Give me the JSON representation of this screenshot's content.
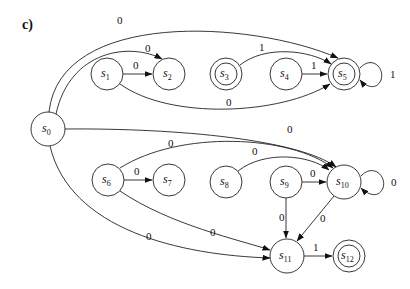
{
  "panel_label": "c)",
  "nodes": [
    {
      "id": "s0",
      "base": "s",
      "sub": "0",
      "x": 48,
      "y": 129,
      "r": 17,
      "accepting": false
    },
    {
      "id": "s1",
      "base": "s",
      "sub": "1",
      "x": 107,
      "y": 74,
      "r": 16,
      "accepting": false
    },
    {
      "id": "s2",
      "base": "s",
      "sub": "2",
      "x": 169,
      "y": 74,
      "r": 16,
      "accepting": false
    },
    {
      "id": "s3",
      "base": "s",
      "sub": "3",
      "x": 226,
      "y": 74,
      "r": 16,
      "accepting": true
    },
    {
      "id": "s4",
      "base": "s",
      "sub": "4",
      "x": 286,
      "y": 74,
      "r": 16,
      "accepting": false
    },
    {
      "id": "s5",
      "base": "s",
      "sub": "5",
      "x": 344,
      "y": 74,
      "r": 16,
      "accepting": true
    },
    {
      "id": "s6",
      "base": "s",
      "sub": "6",
      "x": 108,
      "y": 180,
      "r": 16,
      "accepting": false
    },
    {
      "id": "s7",
      "base": "s",
      "sub": "7",
      "x": 169,
      "y": 180,
      "r": 16,
      "accepting": false
    },
    {
      "id": "s8",
      "base": "s",
      "sub": "8",
      "x": 226,
      "y": 182,
      "r": 16,
      "accepting": false
    },
    {
      "id": "s9",
      "base": "s",
      "sub": "9",
      "x": 286,
      "y": 182,
      "r": 16,
      "accepting": false
    },
    {
      "id": "s10",
      "base": "s",
      "sub": "10",
      "x": 344,
      "y": 182,
      "r": 17,
      "accepting": false
    },
    {
      "id": "s11",
      "base": "s",
      "sub": "11",
      "x": 287,
      "y": 256,
      "r": 17,
      "accepting": false
    },
    {
      "id": "s12",
      "base": "s",
      "sub": "12",
      "x": 349,
      "y": 256,
      "r": 16,
      "accepting": true
    }
  ],
  "edges": [
    {
      "from": "s0",
      "to": "s5",
      "label": "0",
      "path": "M49,112 C60,10 250,20 338,58",
      "lx": 117,
      "ly": 24
    },
    {
      "from": "s0",
      "to": "s2",
      "label": "0",
      "path": "M56,114 C70,50 130,42 162,59",
      "lx": 145,
      "ly": 52
    },
    {
      "from": "s1",
      "to": "s2",
      "label": "0",
      "path": "M123,74 L152,74",
      "lx": 133,
      "ly": 69
    },
    {
      "from": "s1",
      "to": "s5",
      "label": "0",
      "path": "M120,84 C170,120 280,115 330,84",
      "lx": 226,
      "ly": 106
    },
    {
      "from": "s3",
      "to": "s5",
      "label": "1",
      "path": "M240,65 C265,45 310,50 331,64",
      "lx": 259,
      "ly": 51
    },
    {
      "from": "s4",
      "to": "s5",
      "label": "1",
      "path": "M302,74 L327,74",
      "lx": 311,
      "ly": 69
    },
    {
      "from": "s5",
      "to": "s5",
      "label": "1",
      "path": "M360,68 C372,55 385,68 381,80 C376,92 364,85 360,80",
      "lx": 390,
      "ly": 78
    },
    {
      "from": "s0",
      "to": "s10",
      "label": "0",
      "path": "M65,129 C180,128 300,140 336,167",
      "lx": 287,
      "ly": 133
    },
    {
      "from": "s6",
      "to": "s10",
      "label": "0",
      "path": "M120,168 C180,130 290,135 333,168",
      "lx": 168,
      "ly": 147
    },
    {
      "from": "s6",
      "to": "s7",
      "label": "0",
      "path": "M124,180 L152,180",
      "lx": 134,
      "ly": 175
    },
    {
      "from": "s8",
      "to": "s10",
      "label": "0",
      "path": "M238,171 C265,150 310,155 329,170",
      "lx": 252,
      "ly": 155
    },
    {
      "from": "s9",
      "to": "s10",
      "label": "0",
      "path": "M302,182 L326,182",
      "lx": 310,
      "ly": 177
    },
    {
      "from": "s10",
      "to": "s10",
      "label": "0",
      "path": "M361,176 C373,163 387,176 383,188 C378,200 366,193 361,188",
      "lx": 391,
      "ly": 186
    },
    {
      "from": "s9",
      "to": "s11",
      "label": "0",
      "path": "M286,198 L286,238",
      "lx": 279,
      "ly": 221
    },
    {
      "from": "s10",
      "to": "s11",
      "label": "0",
      "path": "M334,196 L297,241",
      "lx": 320,
      "ly": 222
    },
    {
      "from": "s6",
      "to": "s11",
      "label": "0",
      "path": "M120,191 C170,225 240,240 270,250",
      "lx": 210,
      "ly": 236
    },
    {
      "from": "s0",
      "to": "s11",
      "label": "0",
      "path": "M50,146 C70,230 180,255 270,258",
      "lx": 146,
      "ly": 240
    },
    {
      "from": "s11",
      "to": "s12",
      "label": "1",
      "path": "M304,256 L332,256",
      "lx": 313,
      "ly": 251
    }
  ]
}
